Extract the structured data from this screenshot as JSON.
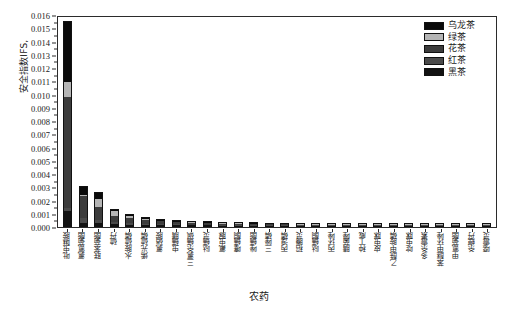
{
  "chart_data": {
    "type": "bar",
    "stacked": true,
    "title": "",
    "xlabel": "农药",
    "ylabel": "安全指数IFS,",
    "ylim": [
      0.0,
      0.016
    ],
    "ytick_step": 0.001,
    "ytick_labels": [
      "0.000",
      "0.001",
      "0.002",
      "0.003",
      "0.004",
      "0.005",
      "0.006",
      "0.007",
      "0.008",
      "0.009",
      "0.010",
      "0.011",
      "0.012",
      "0.013",
      "0.014",
      "0.015",
      "0.016"
    ],
    "grid": false,
    "legend_position": "top-right",
    "categories": [
      "吡虫啉胺",
      "氯氰菊酯",
      "联苯菊酯",
      "硫丹",
      "水胺硫磷",
      "烯光硫磷",
      "氯硝胺",
      "虫螨腈",
      "三氯杀螨砜",
      "哒螨灵",
      "氟虫脲",
      "噻螨酮",
      "唑螨酯",
      "三唑磷",
      "丙溴磷",
      "稻腾灵",
      "哒螨酮",
      "丙环唑",
      "腈菌唑",
      "种丁威",
      "皮虫脒",
      "乙酰甲胺磷",
      "啶虫脒",
      "多杀霉素",
      "苯醚甲环唑",
      "甲氰菊酯",
      "杀螟丹",
      "噁霉灵"
    ],
    "series": [
      {
        "name": "乌龙茶",
        "color": "#0a0a0a",
        "values": [
          0.00455,
          0.0006,
          0.0005,
          0.00011,
          8e-05,
          6e-05,
          5e-05,
          4e-05,
          4e-05,
          3e-05,
          3e-05,
          3e-05,
          2e-05,
          2e-05,
          2e-05,
          2e-05,
          1e-05,
          1e-05,
          1e-05,
          1e-05,
          1e-05,
          1e-05,
          8e-06,
          7e-06,
          6e-06,
          5e-06,
          4e-06,
          4e-06
        ]
      },
      {
        "name": "绿茶",
        "color": "#b5b5b5",
        "values": [
          0.0011,
          0.00014,
          0.00056,
          0.00038,
          0.00012,
          4e-05,
          3e-05,
          3e-05,
          2e-05,
          2e-05,
          2e-05,
          2e-05,
          2e-05,
          1e-05,
          1e-05,
          1e-05,
          1e-05,
          1e-05,
          8e-06,
          8e-06,
          7e-06,
          6e-06,
          5e-06,
          5e-06,
          4e-06,
          4e-06,
          3e-06,
          3e-06
        ]
      },
      {
        "name": "花茶",
        "color": "#3c3c3c",
        "values": [
          0.0084,
          0.0016,
          0.001,
          0.00046,
          0.0004,
          0.0003,
          0.00024,
          0.00018,
          0.00016,
          0.00013,
          0.00011,
          0.0001,
          8e-05,
          7e-05,
          6e-05,
          5e-05,
          5e-05,
          4e-05,
          4e-05,
          3e-05,
          3e-05,
          2e-05,
          2e-05,
          2e-05,
          1e-05,
          1e-05,
          1e-05,
          1e-05
        ]
      },
      {
        "name": "红茶",
        "color": "#4a4a4a",
        "values": [
          0.00025,
          0.00042,
          0.00026,
          0.00016,
          0.00012,
          0.0001,
          8e-05,
          7e-05,
          6e-05,
          5e-05,
          4e-05,
          4e-05,
          3e-05,
          3e-05,
          2e-05,
          2e-05,
          2e-05,
          2e-05,
          1e-05,
          1e-05,
          1e-05,
          1e-05,
          8e-06,
          7e-06,
          6e-06,
          5e-06,
          4e-06,
          4e-06
        ]
      },
      {
        "name": "黑茶",
        "color": "#121212",
        "values": [
          0.0011,
          0.00022,
          0.0002,
          0.00013,
          0.0001,
          8e-05,
          6e-05,
          5e-05,
          4e-05,
          4e-05,
          3e-05,
          3e-05,
          2e-05,
          2e-05,
          2e-05,
          1e-05,
          1e-05,
          1e-05,
          1e-05,
          1e-05,
          8e-06,
          7e-06,
          6e-06,
          5e-06,
          5e-06,
          4e-06,
          3e-06,
          3e-06
        ]
      }
    ],
    "totals": [
      0.0154,
      0.00298,
      0.00252,
      0.00124,
      0.00082,
      0.00058,
      0.00046,
      0.00037,
      0.00032,
      0.00027,
      0.00023,
      0.00022,
      0.00017,
      0.00015,
      0.00013,
      0.00011,
      0.0001,
      9e-05,
      8e-05,
      7e-05,
      6e-05,
      5e-05,
      4e-05,
      4e-05,
      3e-05,
      3e-05,
      2e-05,
      2e-05
    ]
  }
}
